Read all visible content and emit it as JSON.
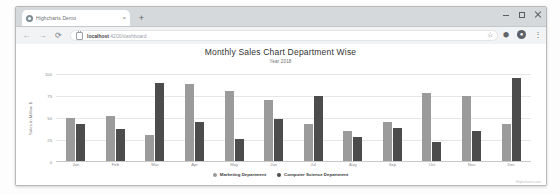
{
  "browser": {
    "tab": {
      "title": "Highcharts Demo",
      "close_label": "×",
      "favicon": "globe-icon"
    },
    "new_tab_label": "+",
    "window_controls": {
      "minimize": "–",
      "maximize": "□",
      "close": "×"
    },
    "nav": {
      "back": "←",
      "forward": "→",
      "reload": "⟳"
    },
    "omnibox": {
      "security_icon": "lock-icon",
      "host": "localhost",
      "path": ":4200/dashboard"
    },
    "toolbar_icons": {
      "bookmark": "☆",
      "extension": "⬢",
      "profile": "●",
      "menu": "⋮"
    }
  },
  "chart_data": {
    "type": "bar",
    "title": "Monthly Sales Chart Department Wise",
    "subtitle": "Year 2018",
    "xlabel": "",
    "ylabel": "Sales in Million $",
    "ylim": [
      0,
      100
    ],
    "yticks": [
      0,
      25,
      50,
      75,
      100
    ],
    "grid": true,
    "legend_position": "bottom",
    "categories": [
      "Jan",
      "Feb",
      "Mar",
      "Apr",
      "May",
      "Jun",
      "Jul",
      "Aug",
      "Sep",
      "Oct",
      "Nov",
      "Dec"
    ],
    "series": [
      {
        "name": "Marketing Department",
        "color": "#9b9b9b",
        "values": [
          50,
          52,
          30,
          88,
          80,
          70,
          42,
          35,
          45,
          78,
          75,
          43
        ]
      },
      {
        "name": "Computer Science Department",
        "color": "#4c4c4c",
        "values": [
          43,
          37,
          90,
          45,
          25,
          48,
          75,
          28,
          38,
          22,
          35,
          95
        ]
      }
    ],
    "credit": "Highcharts.com"
  }
}
